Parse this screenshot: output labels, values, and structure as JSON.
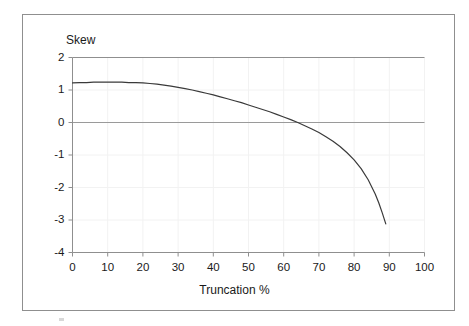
{
  "figure": {
    "name": "skew-vs-truncation-plot",
    "border_color": "#8f8f8f",
    "background": "#ffffff"
  },
  "chart_data": {
    "type": "line",
    "title": "",
    "xlabel": "Truncation %",
    "ylabel": "Skew",
    "xlim": [
      0,
      100
    ],
    "ylim": [
      -4,
      2
    ],
    "grid": true,
    "legend": null,
    "line_color": "#3a3a3a",
    "grid_color": "#f2f2f2",
    "axis_color": "#8f8f8f",
    "zero_line_color": "#9a9a9a",
    "xticks": [
      0,
      10,
      20,
      30,
      40,
      50,
      60,
      70,
      80,
      90,
      100
    ],
    "xtick_labels": [
      "0",
      "10",
      "20",
      "30",
      "40",
      "50",
      "60",
      "70",
      "80",
      "90",
      "100"
    ],
    "yticks": [
      2,
      1,
      0,
      -1,
      -2,
      -3,
      -4
    ],
    "ytick_labels": [
      "2",
      "1",
      "0",
      "-1",
      "-2",
      "-3",
      "-4"
    ],
    "series": [
      {
        "name": "Skew",
        "x": [
          0,
          2,
          4,
          6,
          8,
          10,
          12,
          14,
          16,
          18,
          20,
          22,
          24,
          26,
          28,
          30,
          32,
          34,
          36,
          38,
          40,
          42,
          44,
          46,
          48,
          50,
          52,
          54,
          56,
          58,
          60,
          62,
          64,
          66,
          68,
          70,
          72,
          74,
          76,
          78,
          80,
          82,
          84,
          86,
          87,
          88,
          89
        ],
        "y": [
          1.22,
          1.23,
          1.23,
          1.24,
          1.24,
          1.24,
          1.24,
          1.24,
          1.23,
          1.23,
          1.22,
          1.2,
          1.18,
          1.15,
          1.12,
          1.08,
          1.04,
          1.0,
          0.95,
          0.9,
          0.85,
          0.79,
          0.73,
          0.67,
          0.61,
          0.54,
          0.47,
          0.4,
          0.33,
          0.25,
          0.17,
          0.09,
          0.0,
          -0.1,
          -0.2,
          -0.31,
          -0.44,
          -0.58,
          -0.74,
          -0.93,
          -1.15,
          -1.42,
          -1.76,
          -2.2,
          -2.47,
          -2.78,
          -3.12
        ]
      }
    ],
    "annotations": {
      "zero_crossing_x": 64,
      "max_value": 1.24,
      "min_value": -3.12,
      "curve_end_x": 89
    }
  },
  "axes": {
    "y_title": "Skew",
    "x_title": "Truncation %"
  }
}
